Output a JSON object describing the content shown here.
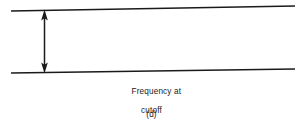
{
  "figure": {
    "panel_label": "(d)",
    "annotation": {
      "line1": "Frequency at",
      "line2": "cutoff"
    },
    "colors": {
      "background": "#ffffff",
      "ink": "#1a1a1a"
    },
    "geometry": {
      "width": 303,
      "height": 129,
      "upper_boundary": {
        "x1": 11,
        "y1": 11,
        "x2": 295,
        "y2": 6
      },
      "lower_boundary": {
        "x1": 11,
        "y1": 73,
        "x2": 295,
        "y2": 69
      },
      "gap_arrow": {
        "x": 44.5,
        "y_top": 10,
        "y_bottom": 72,
        "heads": "both"
      }
    }
  }
}
